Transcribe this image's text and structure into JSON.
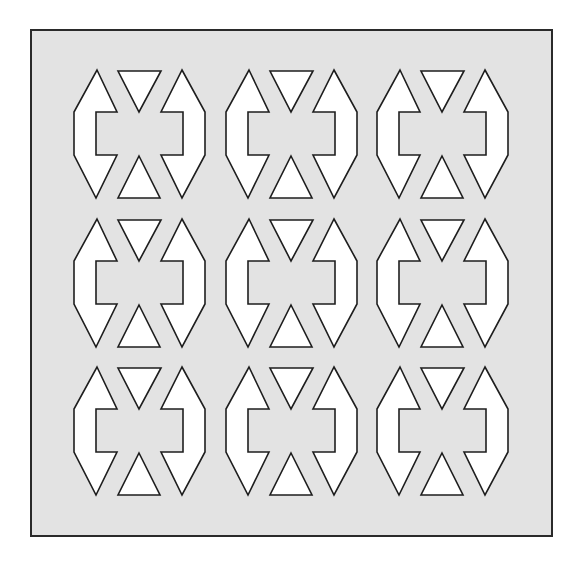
{
  "figure": {
    "width": 573,
    "height": 561,
    "background": "#ffffff",
    "frame": {
      "x": 31,
      "y": 30,
      "width": 521,
      "height": 506,
      "fill": "#e3e3e3",
      "stroke": "#2a2a2a"
    },
    "grid": {
      "rows": 3,
      "columns": 3,
      "column_origins_x": [
        74,
        226,
        377
      ],
      "row_origins_y": [
        70,
        219,
        367
      ]
    },
    "motif": {
      "name": "bracket-hourglass-tile",
      "fill": "#ffffff",
      "stroke": "#1e1e1e",
      "shapes": [
        {
          "name": "left-bracket",
          "points": [
            [
              23,
              0
            ],
            [
              43,
              42
            ],
            [
              22,
              42
            ],
            [
              22,
              85
            ],
            [
              43,
              85
            ],
            [
              22,
              128
            ],
            [
              0,
              85
            ],
            [
              0,
              42
            ]
          ]
        },
        {
          "name": "top-triangle",
          "points": [
            [
              44,
              1
            ],
            [
              87,
              1
            ],
            [
              65,
              42
            ]
          ]
        },
        {
          "name": "bottom-triangle",
          "points": [
            [
              65,
              86
            ],
            [
              86,
              128
            ],
            [
              44,
              128
            ]
          ]
        },
        {
          "name": "right-bracket",
          "points": [
            [
              108,
              0
            ],
            [
              131,
              42
            ],
            [
              131,
              85
            ],
            [
              108,
              128
            ],
            [
              87,
              85
            ],
            [
              109,
              85
            ],
            [
              109,
              42
            ],
            [
              87,
              42
            ]
          ]
        }
      ]
    }
  }
}
